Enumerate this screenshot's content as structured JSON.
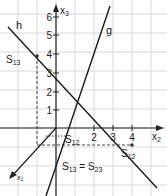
{
  "diagram": {
    "type": "3d-coordinate-lines",
    "axes": {
      "x1": {
        "label": "x",
        "sub": "1"
      },
      "x2": {
        "label": "x",
        "sub": "2",
        "ticks": [
          "2",
          "3",
          "4"
        ]
      },
      "x3": {
        "label": "x",
        "sub": "3",
        "ticks": [
          "1",
          "2",
          "3",
          "4",
          "5",
          "6"
        ]
      }
    },
    "lines": [
      {
        "name": "h",
        "label": "h"
      },
      {
        "name": "g",
        "label": "g"
      }
    ],
    "points": [
      {
        "name": "S13",
        "label": "S",
        "sub": "13"
      },
      {
        "name": "S12_top",
        "label": "S",
        "sub": "12"
      },
      {
        "name": "S12",
        "label": "S",
        "sub": "12"
      },
      {
        "name": "S13=S23",
        "label_a": "S",
        "sub_a": "13",
        "eq": " = ",
        "label_b": "S",
        "sub_b": "23"
      }
    ],
    "colors": {
      "grid": "#cfcfcf",
      "line": "#1a1a1a"
    }
  }
}
